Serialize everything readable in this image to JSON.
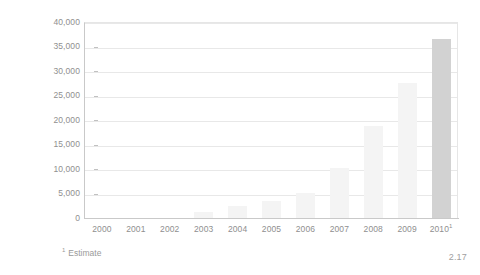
{
  "chart_data": {
    "type": "bar",
    "title": "",
    "xlabel": "",
    "ylabel": "Registrations",
    "categories": [
      "2000",
      "2001",
      "2002",
      "2003",
      "2004",
      "2005",
      "2006",
      "2007",
      "2008",
      "2009",
      "2010"
    ],
    "category_labels": [
      "2000",
      "2001",
      "2002",
      "2003",
      "2004",
      "2005",
      "2006",
      "2007",
      "2008",
      "2009",
      "2010¹"
    ],
    "values": [
      0,
      0,
      0,
      1200,
      2400,
      3500,
      5200,
      10300,
      18800,
      27500,
      36500
    ],
    "ylim": [
      0,
      40000
    ],
    "yticks": [
      0,
      5000,
      10000,
      15000,
      20000,
      25000,
      30000,
      35000,
      40000
    ],
    "ytick_labels": [
      "0",
      "5,000",
      "10,000",
      "15,000",
      "20,000",
      "25,000",
      "30,000",
      "35,000",
      "40,000"
    ],
    "grid": true,
    "legend": "none",
    "estimate_index": 10,
    "series_color": "#f4f4f4",
    "estimate_color": "#d2d2d2",
    "grid_color": "#e8e8e8",
    "axis_color": "#c9c9c9",
    "text_color": "#8f8f8f"
  },
  "footnote": {
    "marker": "1",
    "text": "Estimate"
  },
  "corner_note": "2.17"
}
